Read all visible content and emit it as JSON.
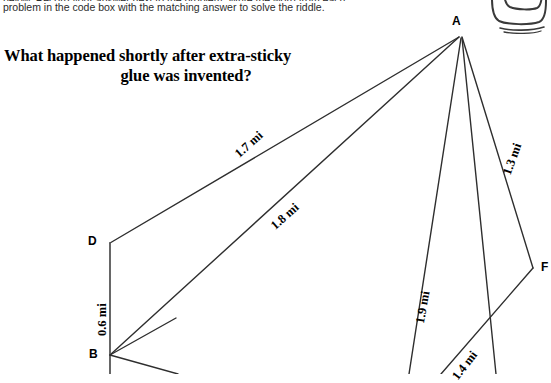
{
  "page": {
    "background_color": "#ffffff",
    "ink_color": "#1a1a1a"
  },
  "instructions": {
    "line1_clipped": "below. Record your answer next to the problem. Write the word from each",
    "line2": "problem in the code box with the matching answer to solve the riddle."
  },
  "riddle": {
    "line1": "What happened shortly after extra-sticky",
    "line2": "glue was invented?"
  },
  "figure": {
    "type": "geometry-diagram",
    "units": "mi",
    "vertices": [
      {
        "id": "A",
        "label": "A",
        "x": 461,
        "y": 36
      },
      {
        "id": "D",
        "label": "D",
        "x": 110,
        "y": 243
      },
      {
        "id": "B",
        "label": "B",
        "x": 110,
        "y": 355
      },
      {
        "id": "F",
        "label": "F",
        "x": 533,
        "y": 268
      }
    ],
    "segments": [
      {
        "id": "DA",
        "label": "1.7 mi",
        "value": 1.7,
        "from": "D",
        "to": "A"
      },
      {
        "id": "BA",
        "label": "1.8 mi",
        "value": 1.8,
        "from": "B",
        "to": "A"
      },
      {
        "id": "AF",
        "label": "1.3 mi",
        "value": 1.3,
        "from": "A",
        "to": "F"
      },
      {
        "id": "AE",
        "label": "1.9 mi",
        "value": 1.9,
        "from": "A",
        "to": "E"
      },
      {
        "id": "AG",
        "label": "1.4 mi",
        "value": 1.4,
        "from": "A",
        "to": "G"
      },
      {
        "id": "DB",
        "label": "0.6 mi",
        "value": 0.6,
        "from": "D",
        "to": "B"
      }
    ],
    "measure_labels": {
      "m17": "1.7 mi",
      "m18": "1.8 mi",
      "m13": "1.3 mi",
      "m19": "1.9 mi",
      "m14": "1.4 mi",
      "m06": "0.6 mi"
    }
  },
  "doodle": {
    "name": "hand-drawn-box-sketch"
  }
}
